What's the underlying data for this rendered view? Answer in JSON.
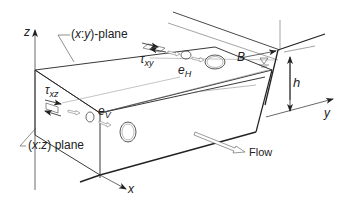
{
  "figure": {
    "labels": {
      "z_axis": "z",
      "x_axis": "x",
      "y_axis": "y",
      "xy_plane": "(x:y)-plane",
      "xy_plane_parts": {
        "open": "(",
        "v1": "x",
        "sep": ":",
        "v2": "y",
        "close": ")-plane"
      },
      "xz_plane": "(x:z) plane",
      "xz_plane_parts": {
        "open": "(",
        "v1": "x",
        "sep": ":",
        "v2": "z",
        "close": ") plane"
      },
      "tau_xy": {
        "sym": "τ",
        "sub": "xy"
      },
      "tau_xz": {
        "sym": "τ",
        "sub": "xz"
      },
      "e_H": {
        "sym": "e",
        "sub": "H"
      },
      "e_V": {
        "sym": "e",
        "sub": "V"
      },
      "width": "B",
      "depth": "h",
      "flow": "Flow"
    },
    "colors": {
      "line": "#222222",
      "thin_line": "#555555",
      "background": "#ffffff"
    }
  }
}
